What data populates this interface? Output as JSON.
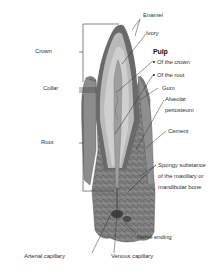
{
  "diagram": {
    "labels_left": [
      {
        "id": "crown",
        "text": "Crown"
      },
      {
        "id": "collar",
        "text": "Collar"
      },
      {
        "id": "root",
        "text": "Root"
      }
    ],
    "labels_right": [
      {
        "id": "enamel",
        "text": "Enamel"
      },
      {
        "id": "ivory",
        "text": "Ivory"
      },
      {
        "id": "pulp",
        "text": "Pulp"
      },
      {
        "id": "pulp_crown",
        "text": "Of the crown"
      },
      {
        "id": "pulp_root",
        "text": "Of the root"
      },
      {
        "id": "gum",
        "text": "Gum"
      },
      {
        "id": "alveolar1",
        "text": "Alveolar"
      },
      {
        "id": "alveolar2",
        "text": "periosteum"
      },
      {
        "id": "cement",
        "text": "Cement"
      },
      {
        "id": "spongy1",
        "text": "Spongy substance"
      },
      {
        "id": "spongy2",
        "text": "of the maxillary or"
      },
      {
        "id": "spongy3",
        "text": "mandibular bone"
      }
    ],
    "labels_bottom": [
      {
        "id": "nerve",
        "text": "Nerve ending"
      },
      {
        "id": "arterial",
        "text": "Arterial capillary"
      },
      {
        "id": "venous",
        "text": "Venous capillary"
      }
    ],
    "colors": {
      "background": "#ffffff",
      "line": "#333333",
      "tooth_dark": "#6f6f6f",
      "tooth_mid": "#9a9a9a",
      "tooth_light": "#c9c9c9",
      "bone": "#7d7d7d"
    }
  }
}
